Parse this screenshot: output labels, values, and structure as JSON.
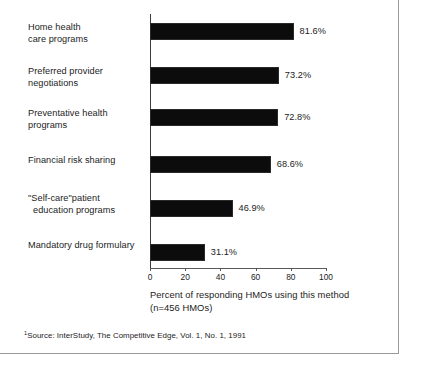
{
  "chart_data": {
    "type": "bar",
    "orientation": "horizontal",
    "title": "",
    "subtitle": "",
    "xlabel": "Percent of responding HMOs using this method",
    "xlabel_line2": "(n=456 HMOs)",
    "ylabel": "",
    "xlim": [
      0,
      100
    ],
    "xticks": [
      0,
      20,
      40,
      60,
      80,
      100
    ],
    "xtick_labels": [
      "0",
      "20",
      "40",
      "60",
      "80",
      "100"
    ],
    "grid": false,
    "legend": null,
    "bar_color": "#0c0c0c",
    "categories": [
      "Home health care programs",
      "Preferred provider negotiations",
      "Preventative health programs",
      "Financial risk sharing",
      "\"Self-care\"patient education programs",
      "Mandatory drug formulary"
    ],
    "category_lines": [
      [
        "Home health",
        "care programs"
      ],
      [
        "Preferred provider",
        "negotiations"
      ],
      [
        "Preventative health",
        "programs"
      ],
      [
        "Financial risk sharing",
        ""
      ],
      [
        "\"Self-care\"patient",
        "education programs"
      ],
      [
        "Mandatory drug formulary",
        ""
      ]
    ],
    "values": [
      81.6,
      73.2,
      72.8,
      68.6,
      46.9,
      31.1
    ],
    "data_labels": [
      "81.6%",
      "73.2%",
      "72.8%",
      "68.6%",
      "46.9%",
      "31.1%"
    ]
  },
  "source": {
    "marker": "1",
    "text": "Source: InterStudy, The Competitive Edge, Vol. 1, No. 1, 1991"
  }
}
